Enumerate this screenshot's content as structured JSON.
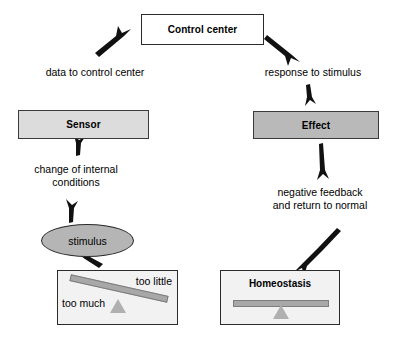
{
  "diagram": {
    "nodes": {
      "control_center": "Control center",
      "sensor": "Sensor",
      "effect": "Effect",
      "stimulus": "stimulus",
      "homeostasis": "Homeostasis"
    },
    "edge_labels": {
      "data_to_control_center": "data to control center",
      "response_to_stimulus": "response to stimulus",
      "change_of_internal_conditions": "change of internal\nconditions",
      "negative_feedback": "negative feedback\nand return to normal"
    },
    "scale_labels": {
      "too_little": "too\nlittle",
      "too_much": "too\nmuch"
    },
    "colors": {
      "control_center_fill": "#ffffff",
      "sensor_fill": "#dcdcdc",
      "effect_fill": "#b9b9b9",
      "stimulus_fill": "#b5b5b5",
      "panel_fill": "#f2f2f2",
      "beam_fill": "#a8a8a8",
      "fulcrum_fill": "#b0b0b0",
      "stroke": "#1a1a1a",
      "background": "#ffffff"
    }
  }
}
